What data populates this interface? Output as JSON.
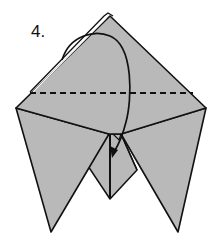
{
  "diagram": {
    "step_label": "4.",
    "paper_color": "#b9b9b9",
    "line_color": "#111111",
    "elements": [
      {
        "name": "upper-kite-face",
        "kind": "paper-face"
      },
      {
        "name": "left-flap",
        "kind": "paper-face"
      },
      {
        "name": "right-flap",
        "kind": "paper-face"
      },
      {
        "name": "center-pocket",
        "kind": "paper-face"
      },
      {
        "name": "valley-fold-line",
        "kind": "dashed-fold-line"
      },
      {
        "name": "fold-arrow",
        "kind": "curved-arrow",
        "meaning": "fold top point down along dashed line"
      }
    ]
  }
}
